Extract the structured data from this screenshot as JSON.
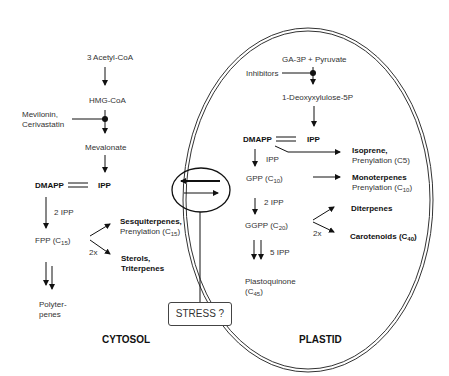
{
  "cytosol": {
    "title": "CYTOSOL",
    "acetyl": "3 Acetyl-CoA",
    "hmg": "HMG-CoA",
    "inhibitor_line1": "Mevilonin,",
    "inhibitor_line2": "Cerivastatin",
    "mevalonate": "Mevalonate",
    "dmapp": "DMAPP",
    "ipp": "IPP",
    "step_2ipp": "2 IPP",
    "fpp": "FPP (C",
    "fpp_sub": "15",
    "fpp_close": ")",
    "sesqui": "Sesquiterpenes,",
    "prenyl15": "Prenylation (C",
    "prenyl15_sub": "15",
    "prenyl15_close": ")",
    "twox": "2x",
    "sterols": "Sterols,",
    "triterpenes": "Triterpenes",
    "poly1": "Polyter-",
    "poly2": "penes"
  },
  "plastid": {
    "title": "PLASTID",
    "ga3p": "GA-3P  +  Pyruvate",
    "inhibitors": "Inhibitors",
    "dxp": "1-Deoxyxylulose-5P",
    "dmapp": "DMAPP",
    "ipp": "IPP",
    "ipp_step": "IPP",
    "isoprene": "Isoprene,",
    "prenyl5": "Prenylation (C5)",
    "gpp": "GPP (C",
    "gpp_sub": "10",
    "gpp_close": ")",
    "mono": "Monoterpenes",
    "prenyl10": "Prenylation (C",
    "prenyl10_sub": "10",
    "prenyl10_close": ")",
    "step_2ipp": "2 IPP",
    "ggpp": "GGPP (C",
    "ggpp_sub": "20",
    "ggpp_close": ")",
    "diterpenes": "Diterpenes",
    "twox": "2x",
    "carot": "Carotenoids (C",
    "carot_sub": "40",
    "carot_close": ")",
    "step_5ipp": "5 IPP",
    "plasto1": "Plastoquinone",
    "plasto2": "(C",
    "plasto_sub": "45",
    "plasto_close": ")"
  },
  "stress": "STRESS ?"
}
